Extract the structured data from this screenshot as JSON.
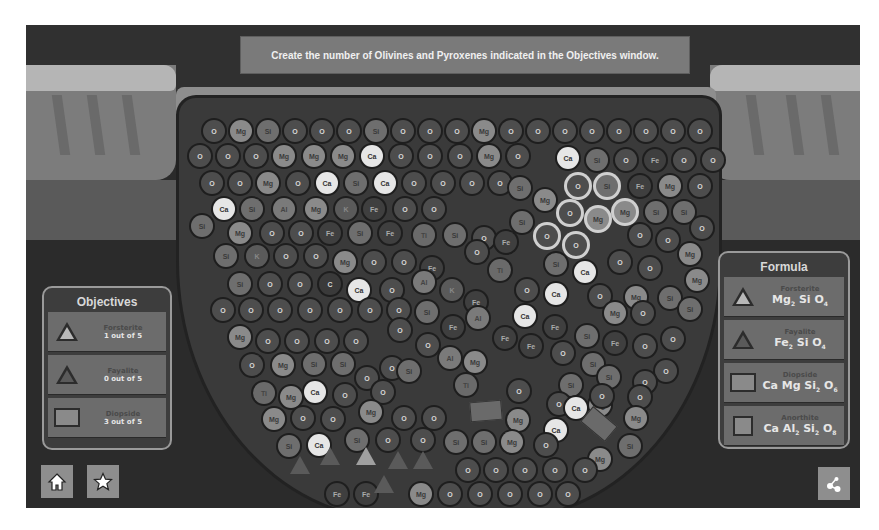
{
  "banner": {
    "text": "Create the number of Olivines and Pyroxenes indicated in the Objectives window."
  },
  "objectives": {
    "title": "Objectives",
    "items": [
      {
        "name": "Forsterite",
        "progress": "1 out of 5",
        "icon": "triangle-light-icon"
      },
      {
        "name": "Fayalite",
        "progress": "0 out of 5",
        "icon": "triangle-dark-icon"
      },
      {
        "name": "Diopside",
        "progress": "3 out of 5",
        "icon": "rectangle-icon"
      }
    ]
  },
  "formula": {
    "title": "Formula",
    "items": [
      {
        "name": "Forsterite",
        "formula": [
          "Mg",
          "2",
          " Si O",
          "4"
        ],
        "icon": "triangle-light-icon"
      },
      {
        "name": "Fayalite",
        "formula": [
          "Fe",
          "2",
          " Si O",
          "4"
        ],
        "icon": "triangle-dark-icon"
      },
      {
        "name": "Diopside",
        "formula": [
          "Ca Mg Si",
          "2",
          " O",
          "6"
        ],
        "icon": "rectangle-icon"
      },
      {
        "name": "Anorthite",
        "formula": [
          "Ca Al",
          "2",
          " Si",
          "2",
          " O",
          "8"
        ],
        "icon": "square-icon"
      }
    ]
  },
  "buttons": {
    "home": "home-icon",
    "star": "star-icon",
    "share": "share-icon"
  },
  "atoms": [
    {
      "e": "O",
      "x": 214,
      "y": 131
    },
    {
      "e": "Mg",
      "x": 241,
      "y": 131
    },
    {
      "e": "Si",
      "x": 268,
      "y": 131
    },
    {
      "e": "O",
      "x": 295,
      "y": 131
    },
    {
      "e": "O",
      "x": 322,
      "y": 131
    },
    {
      "e": "O",
      "x": 349,
      "y": 131
    },
    {
      "e": "Si",
      "x": 376,
      "y": 131
    },
    {
      "e": "O",
      "x": 403,
      "y": 131
    },
    {
      "e": "O",
      "x": 430,
      "y": 131
    },
    {
      "e": "O",
      "x": 457,
      "y": 131
    },
    {
      "e": "Mg",
      "x": 484,
      "y": 131
    },
    {
      "e": "O",
      "x": 511,
      "y": 131
    },
    {
      "e": "O",
      "x": 538,
      "y": 131
    },
    {
      "e": "O",
      "x": 565,
      "y": 131
    },
    {
      "e": "O",
      "x": 592,
      "y": 131
    },
    {
      "e": "O",
      "x": 619,
      "y": 131
    },
    {
      "e": "O",
      "x": 646,
      "y": 131
    },
    {
      "e": "O",
      "x": 673,
      "y": 131
    },
    {
      "e": "O",
      "x": 700,
      "y": 131
    },
    {
      "e": "O",
      "x": 200,
      "y": 156
    },
    {
      "e": "O",
      "x": 228,
      "y": 156
    },
    {
      "e": "O",
      "x": 256,
      "y": 156
    },
    {
      "e": "Mg",
      "x": 284,
      "y": 156
    },
    {
      "e": "Mg",
      "x": 314,
      "y": 156
    },
    {
      "e": "Mg",
      "x": 343,
      "y": 156
    },
    {
      "e": "Ca",
      "x": 372,
      "y": 156
    },
    {
      "e": "O",
      "x": 401,
      "y": 156
    },
    {
      "e": "O",
      "x": 430,
      "y": 156
    },
    {
      "e": "O",
      "x": 460,
      "y": 156
    },
    {
      "e": "Mg",
      "x": 489,
      "y": 156
    },
    {
      "e": "O",
      "x": 518,
      "y": 156
    },
    {
      "e": "Ca",
      "x": 568,
      "y": 158
    },
    {
      "e": "Si",
      "x": 597,
      "y": 160
    },
    {
      "e": "O",
      "x": 626,
      "y": 160
    },
    {
      "e": "Fe",
      "x": 655,
      "y": 160
    },
    {
      "e": "O",
      "x": 684,
      "y": 160
    },
    {
      "e": "O",
      "x": 713,
      "y": 160
    },
    {
      "e": "O",
      "x": 212,
      "y": 183
    },
    {
      "e": "O",
      "x": 240,
      "y": 183
    },
    {
      "e": "Mg",
      "x": 268,
      "y": 183
    },
    {
      "e": "O",
      "x": 298,
      "y": 183
    },
    {
      "e": "Ca",
      "x": 327,
      "y": 183
    },
    {
      "e": "Si",
      "x": 356,
      "y": 183
    },
    {
      "e": "Ca",
      "x": 385,
      "y": 183
    },
    {
      "e": "O",
      "x": 414,
      "y": 183
    },
    {
      "e": "O",
      "x": 443,
      "y": 183
    },
    {
      "e": "O",
      "x": 472,
      "y": 183
    },
    {
      "e": "O",
      "x": 500,
      "y": 183
    },
    {
      "e": "Si",
      "x": 520,
      "y": 188
    },
    {
      "e": "O",
      "x": 578,
      "y": 186,
      "sel": true
    },
    {
      "e": "Si",
      "x": 607,
      "y": 186,
      "sel": true
    },
    {
      "e": "Fe",
      "x": 640,
      "y": 186
    },
    {
      "e": "Mg",
      "x": 670,
      "y": 186
    },
    {
      "e": "O",
      "x": 700,
      "y": 186
    },
    {
      "e": "Ca",
      "x": 224,
      "y": 209
    },
    {
      "e": "Si",
      "x": 252,
      "y": 209
    },
    {
      "e": "Al",
      "x": 284,
      "y": 209
    },
    {
      "e": "Mg",
      "x": 316,
      "y": 209
    },
    {
      "e": "K",
      "x": 346,
      "y": 209
    },
    {
      "e": "Fe",
      "x": 374,
      "y": 209
    },
    {
      "e": "O",
      "x": 405,
      "y": 209
    },
    {
      "e": "O",
      "x": 434,
      "y": 209
    },
    {
      "e": "Mg",
      "x": 545,
      "y": 200
    },
    {
      "e": "O",
      "x": 570,
      "y": 213,
      "sel": true
    },
    {
      "e": "Mg",
      "x": 598,
      "y": 219,
      "sel": true
    },
    {
      "e": "Mg",
      "x": 625,
      "y": 212,
      "sel": true
    },
    {
      "e": "Si",
      "x": 656,
      "y": 212
    },
    {
      "e": "Si",
      "x": 684,
      "y": 212
    },
    {
      "e": "Si",
      "x": 202,
      "y": 226
    },
    {
      "e": "Mg",
      "x": 240,
      "y": 233
    },
    {
      "e": "O",
      "x": 272,
      "y": 233
    },
    {
      "e": "O",
      "x": 301,
      "y": 233
    },
    {
      "e": "Fe",
      "x": 330,
      "y": 233
    },
    {
      "e": "Si",
      "x": 360,
      "y": 233
    },
    {
      "e": "Fe",
      "x": 390,
      "y": 233
    },
    {
      "e": "Ti",
      "x": 424,
      "y": 235
    },
    {
      "e": "Si",
      "x": 455,
      "y": 235
    },
    {
      "e": "O",
      "x": 484,
      "y": 238
    },
    {
      "e": "Si",
      "x": 522,
      "y": 222
    },
    {
      "e": "O",
      "x": 547,
      "y": 236,
      "sel": true
    },
    {
      "e": "O",
      "x": 576,
      "y": 245,
      "sel": true
    },
    {
      "e": "O",
      "x": 640,
      "y": 235
    },
    {
      "e": "O",
      "x": 668,
      "y": 240
    },
    {
      "e": "O",
      "x": 702,
      "y": 228
    },
    {
      "e": "Si",
      "x": 226,
      "y": 256
    },
    {
      "e": "K",
      "x": 257,
      "y": 256
    },
    {
      "e": "O",
      "x": 286,
      "y": 256
    },
    {
      "e": "O",
      "x": 316,
      "y": 256
    },
    {
      "e": "Mg",
      "x": 345,
      "y": 262
    },
    {
      "e": "O",
      "x": 374,
      "y": 262
    },
    {
      "e": "O",
      "x": 404,
      "y": 262
    },
    {
      "e": "Fe",
      "x": 432,
      "y": 268
    },
    {
      "e": "Fe",
      "x": 506,
      "y": 242
    },
    {
      "e": "O",
      "x": 477,
      "y": 252
    },
    {
      "e": "Ti",
      "x": 500,
      "y": 270
    },
    {
      "e": "Si",
      "x": 556,
      "y": 264
    },
    {
      "e": "Ca",
      "x": 585,
      "y": 272
    },
    {
      "e": "O",
      "x": 620,
      "y": 262
    },
    {
      "e": "O",
      "x": 650,
      "y": 268
    },
    {
      "e": "Mg",
      "x": 690,
      "y": 254
    },
    {
      "e": "Si",
      "x": 240,
      "y": 284
    },
    {
      "e": "O",
      "x": 270,
      "y": 284
    },
    {
      "e": "O",
      "x": 300,
      "y": 284
    },
    {
      "e": "C",
      "x": 330,
      "y": 284
    },
    {
      "e": "Ca",
      "x": 359,
      "y": 290
    },
    {
      "e": "O",
      "x": 392,
      "y": 290
    },
    {
      "e": "Al",
      "x": 424,
      "y": 282
    },
    {
      "e": "K",
      "x": 452,
      "y": 290
    },
    {
      "e": "Fe",
      "x": 476,
      "y": 302
    },
    {
      "e": "O",
      "x": 527,
      "y": 290
    },
    {
      "e": "Ca",
      "x": 556,
      "y": 294
    },
    {
      "e": "O",
      "x": 600,
      "y": 296
    },
    {
      "e": "Mg",
      "x": 636,
      "y": 297
    },
    {
      "e": "Si",
      "x": 670,
      "y": 298
    },
    {
      "e": "Mg",
      "x": 697,
      "y": 280
    },
    {
      "e": "O",
      "x": 223,
      "y": 310
    },
    {
      "e": "O",
      "x": 251,
      "y": 310
    },
    {
      "e": "O",
      "x": 280,
      "y": 310
    },
    {
      "e": "O",
      "x": 310,
      "y": 310
    },
    {
      "e": "O",
      "x": 340,
      "y": 310
    },
    {
      "e": "O",
      "x": 370,
      "y": 310
    },
    {
      "e": "O",
      "x": 399,
      "y": 310
    },
    {
      "e": "Si",
      "x": 427,
      "y": 312
    },
    {
      "e": "Fe",
      "x": 453,
      "y": 327
    },
    {
      "e": "Al",
      "x": 478,
      "y": 318
    },
    {
      "e": "Ca",
      "x": 525,
      "y": 316
    },
    {
      "e": "Fe",
      "x": 555,
      "y": 327
    },
    {
      "e": "Mg",
      "x": 615,
      "y": 313
    },
    {
      "e": "O",
      "x": 643,
      "y": 313
    },
    {
      "e": "Si",
      "x": 690,
      "y": 309
    },
    {
      "e": "Mg",
      "x": 240,
      "y": 337
    },
    {
      "e": "O",
      "x": 268,
      "y": 341
    },
    {
      "e": "O",
      "x": 297,
      "y": 341
    },
    {
      "e": "O",
      "x": 327,
      "y": 341
    },
    {
      "e": "O",
      "x": 356,
      "y": 341
    },
    {
      "e": "O",
      "x": 400,
      "y": 330
    },
    {
      "e": "O",
      "x": 428,
      "y": 345
    },
    {
      "e": "Fe",
      "x": 505,
      "y": 338
    },
    {
      "e": "Fe",
      "x": 531,
      "y": 346
    },
    {
      "e": "Si",
      "x": 587,
      "y": 336
    },
    {
      "e": "Fe",
      "x": 615,
      "y": 343
    },
    {
      "e": "O",
      "x": 645,
      "y": 346
    },
    {
      "e": "O",
      "x": 673,
      "y": 339
    },
    {
      "e": "O",
      "x": 252,
      "y": 365
    },
    {
      "e": "Mg",
      "x": 283,
      "y": 365
    },
    {
      "e": "Si",
      "x": 314,
      "y": 364
    },
    {
      "e": "Si",
      "x": 343,
      "y": 364
    },
    {
      "e": "O",
      "x": 367,
      "y": 378
    },
    {
      "e": "O",
      "x": 392,
      "y": 368
    },
    {
      "e": "Si",
      "x": 409,
      "y": 371
    },
    {
      "e": "Al",
      "x": 450,
      "y": 358
    },
    {
      "e": "Mg",
      "x": 475,
      "y": 362
    },
    {
      "e": "O",
      "x": 563,
      "y": 353
    },
    {
      "e": "Si",
      "x": 593,
      "y": 364
    },
    {
      "e": "O",
      "x": 666,
      "y": 371
    },
    {
      "e": "O",
      "x": 645,
      "y": 382
    },
    {
      "e": "Ti",
      "x": 264,
      "y": 393
    },
    {
      "e": "Mg",
      "x": 291,
      "y": 397
    },
    {
      "e": "Ca",
      "x": 315,
      "y": 392
    },
    {
      "e": "O",
      "x": 345,
      "y": 395
    },
    {
      "e": "O",
      "x": 383,
      "y": 392
    },
    {
      "e": "Ti",
      "x": 466,
      "y": 385
    },
    {
      "e": "O",
      "x": 519,
      "y": 391
    },
    {
      "e": "Si",
      "x": 571,
      "y": 385
    },
    {
      "e": "Si",
      "x": 609,
      "y": 377
    },
    {
      "e": "O",
      "x": 559,
      "y": 404
    },
    {
      "e": "Mg",
      "x": 600,
      "y": 405
    },
    {
      "e": "O",
      "x": 640,
      "y": 397
    },
    {
      "e": "Mg",
      "x": 274,
      "y": 419
    },
    {
      "e": "O",
      "x": 303,
      "y": 418
    },
    {
      "e": "O",
      "x": 333,
      "y": 419
    },
    {
      "e": "Mg",
      "x": 371,
      "y": 412
    },
    {
      "e": "O",
      "x": 404,
      "y": 418
    },
    {
      "e": "O",
      "x": 434,
      "y": 418
    },
    {
      "e": "Ca",
      "x": 576,
      "y": 408
    },
    {
      "e": "Mg",
      "x": 518,
      "y": 420
    },
    {
      "e": "Ca",
      "x": 556,
      "y": 430
    },
    {
      "e": "O",
      "x": 602,
      "y": 396
    },
    {
      "e": "Mg",
      "x": 636,
      "y": 418
    },
    {
      "e": "Si",
      "x": 289,
      "y": 446
    },
    {
      "e": "Ca",
      "x": 319,
      "y": 445
    },
    {
      "e": "Si",
      "x": 357,
      "y": 440
    },
    {
      "e": "O",
      "x": 388,
      "y": 440
    },
    {
      "e": "O",
      "x": 423,
      "y": 440
    },
    {
      "e": "Si",
      "x": 456,
      "y": 442
    },
    {
      "e": "Si",
      "x": 484,
      "y": 442
    },
    {
      "e": "Mg",
      "x": 512,
      "y": 442
    },
    {
      "e": "O",
      "x": 546,
      "y": 445
    },
    {
      "e": "Mg",
      "x": 600,
      "y": 459
    },
    {
      "e": "Si",
      "x": 630,
      "y": 446
    },
    {
      "e": "O",
      "x": 468,
      "y": 470
    },
    {
      "e": "O",
      "x": 496,
      "y": 470
    },
    {
      "e": "O",
      "x": 525,
      "y": 470
    },
    {
      "e": "O",
      "x": 555,
      "y": 470
    },
    {
      "e": "O",
      "x": 585,
      "y": 470
    },
    {
      "e": "Fe",
      "x": 337,
      "y": 494
    },
    {
      "e": "Fe",
      "x": 366,
      "y": 494
    },
    {
      "e": "Mg",
      "x": 421,
      "y": 494
    },
    {
      "e": "O",
      "x": 450,
      "y": 494
    },
    {
      "e": "O",
      "x": 480,
      "y": 494
    },
    {
      "e": "O",
      "x": 510,
      "y": 494
    },
    {
      "e": "O",
      "x": 540,
      "y": 494
    },
    {
      "e": "O",
      "x": 568,
      "y": 494
    }
  ],
  "minerals": [
    {
      "type": "tri",
      "x": 300,
      "y": 465,
      "light": false
    },
    {
      "type": "tri",
      "x": 330,
      "y": 456,
      "light": false
    },
    {
      "type": "tri",
      "x": 366,
      "y": 456,
      "light": true
    },
    {
      "type": "tri",
      "x": 398,
      "y": 460,
      "light": false
    },
    {
      "type": "tri",
      "x": 423,
      "y": 460,
      "light": false
    },
    {
      "type": "tri",
      "x": 384,
      "y": 484,
      "light": false
    },
    {
      "type": "rect",
      "x": 480,
      "y": 410,
      "rot": -5
    },
    {
      "type": "rect",
      "x": 593,
      "y": 423,
      "rot": 40
    }
  ]
}
